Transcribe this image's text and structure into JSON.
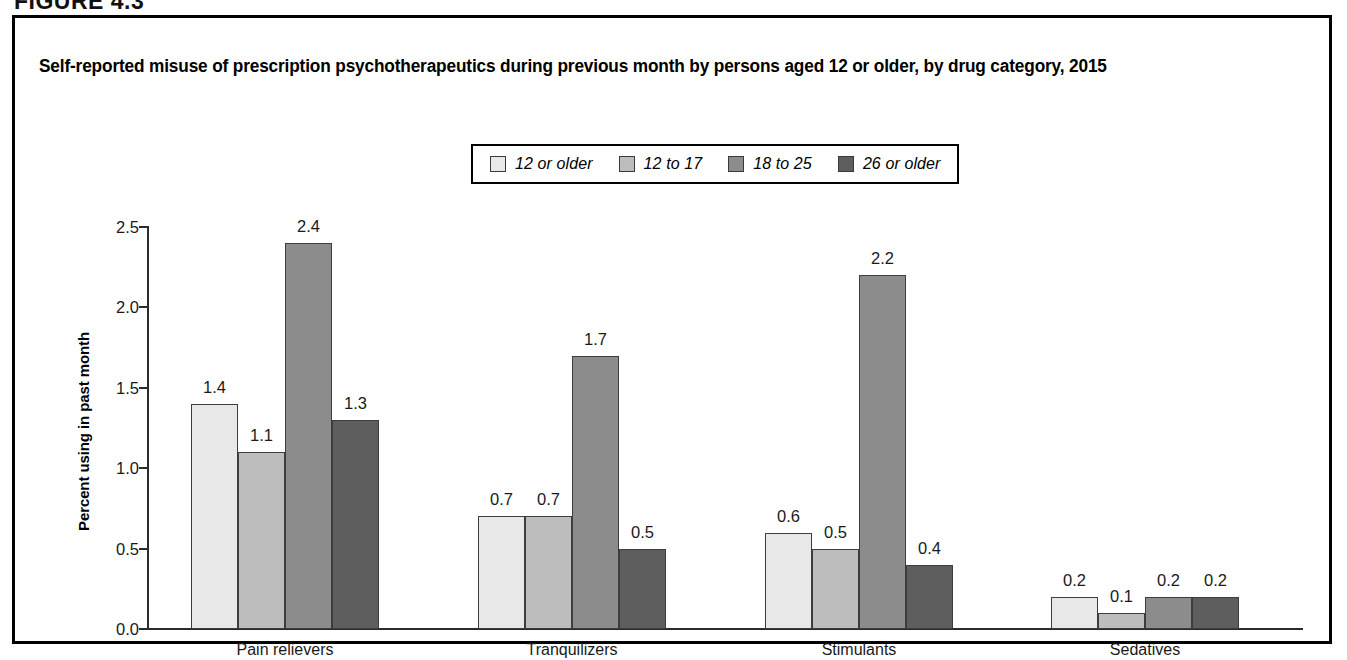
{
  "figure": {
    "number_label": "FIGURE 4.3"
  },
  "chart_title": "Self-reported misuse of prescription psychotherapeutics during previous month by persons aged 12 or older, by drug category, 2015",
  "axis": {
    "y_title": "Percent using in past month",
    "y_ticks": [
      "0.0",
      "0.5",
      "1.0",
      "1.5",
      "2.0",
      "2.5"
    ]
  },
  "legend": {
    "items": [
      {
        "label": "12 or older",
        "color": "#e8e8e8"
      },
      {
        "label": "12 to 17",
        "color": "#bdbdbd"
      },
      {
        "label": "18 to 25",
        "color": "#8c8c8c"
      },
      {
        "label": "26 or older",
        "color": "#5e5e5e"
      }
    ]
  },
  "chart_data": {
    "type": "bar",
    "title": "Self-reported misuse of prescription psychotherapeutics during previous month by persons aged 12 or older, by drug category, 2015",
    "xlabel": "",
    "ylabel": "Percent using in past month",
    "ylim": [
      0.0,
      2.5
    ],
    "yticks": [
      0.0,
      0.5,
      1.0,
      1.5,
      2.0,
      2.5
    ],
    "grid": false,
    "legend_position": "top-center",
    "categories": [
      "Pain relievers",
      "Tranquilizers",
      "Stimulants",
      "Sedatives"
    ],
    "series": [
      {
        "name": "12 or older",
        "color": "#e8e8e8",
        "values": [
          1.4,
          0.7,
          0.6,
          0.2
        ],
        "labels": [
          "1.4",
          "0.7",
          "0.6",
          "0.2"
        ]
      },
      {
        "name": "12 to 17",
        "color": "#bdbdbd",
        "values": [
          1.1,
          0.7,
          0.5,
          0.1
        ],
        "labels": [
          "1.1",
          "0.7",
          "0.5",
          "0.1"
        ]
      },
      {
        "name": "18 to 25",
        "color": "#8c8c8c",
        "values": [
          2.4,
          1.7,
          2.2,
          0.2
        ],
        "labels": [
          "2.4",
          "1.7",
          "2.2",
          "0.2"
        ]
      },
      {
        "name": "26 or older",
        "color": "#5e5e5e",
        "values": [
          1.3,
          0.5,
          0.4,
          0.2
        ],
        "labels": [
          "1.3",
          "0.5",
          "0.4",
          "0.2"
        ]
      }
    ]
  }
}
